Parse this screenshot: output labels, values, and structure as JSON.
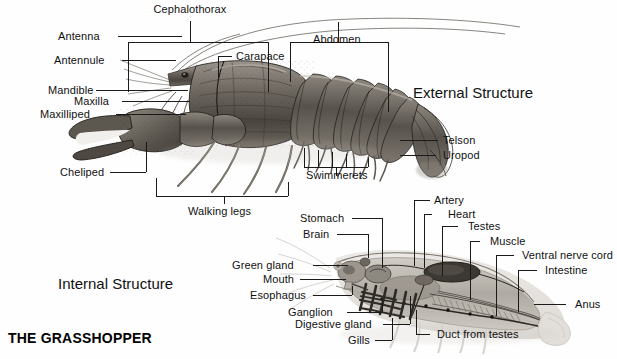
{
  "page": {
    "footer_title": "THE GRASSHOPPER",
    "background": "#fefefe",
    "ink": "#1a1a1a"
  },
  "sections": {
    "external": "External Structure",
    "internal": "Internal Structure"
  },
  "external_labels": {
    "cephalothorax": "Cephalothorax",
    "antenna": "Antenna",
    "antennule": "Antennule",
    "carapace": "Carapace",
    "abdomen": "Abdomen",
    "mandible": "Mandible",
    "maxilla": "Maxilla",
    "maxilliped": "Maxilliped",
    "cheliped": "Cheliped",
    "telson": "Telson",
    "uropod": "Uropod",
    "swimmerets": "Swimmerets",
    "walking_legs": "Walking legs"
  },
  "internal_labels": {
    "stomach": "Stomach",
    "brain": "Brain",
    "green_gland": "Green gland",
    "mouth": "Mouth",
    "esophagus": "Esophagus",
    "ganglion": "Ganglion",
    "digestive_gland": "Digestive gland",
    "gills": "Gills",
    "artery": "Artery",
    "heart": "Heart",
    "testes": "Testes",
    "muscle": "Muscle",
    "ventral_nerve_cord": "Ventral nerve cord",
    "intestine": "Intestine",
    "anus": "Anus",
    "duct_from_testes": "Duct from testes"
  }
}
